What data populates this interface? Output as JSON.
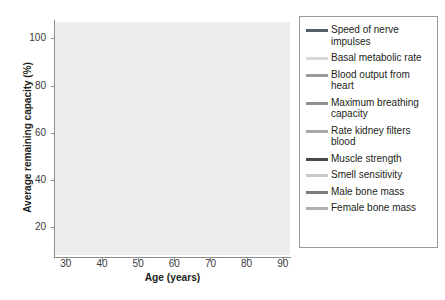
{
  "chart_data": {
    "type": "line",
    "title": "",
    "xlabel": "Age (years)",
    "ylabel": "Average remaining capacity (%)",
    "x": [
      30,
      40,
      50,
      60,
      70,
      80,
      90
    ],
    "xlim": [
      27,
      92
    ],
    "ylim": [
      8,
      107
    ],
    "xticks": [
      "30",
      "40",
      "50",
      "60",
      "70",
      "80",
      "90"
    ],
    "yticks": [
      "20",
      "40",
      "60",
      "80",
      "100"
    ],
    "grid": true,
    "grid_color": "#ffffff",
    "plot_background": "#ededed",
    "legend_position": "right-outside",
    "series": [
      {
        "name": "Speed of nerve impulses",
        "color": "#55606a",
        "width": 2.6,
        "x": [
          30,
          40,
          50,
          60,
          70,
          80
        ],
        "values": [
          100.5,
          100.2,
          99.6,
          99.2,
          98.6,
          98.0
        ]
      },
      {
        "name": "Basal metabolic rate",
        "color": "#d8d8d8",
        "width": 2.6,
        "x": [
          30,
          40,
          50,
          60,
          70,
          80,
          90
        ],
        "values": [
          100.5,
          97.0,
          93.0,
          89.5,
          86.0,
          83.0,
          80.0
        ]
      },
      {
        "name": "Blood output from heart",
        "color": "#9a9a9a",
        "width": 2.8,
        "x": [
          30,
          40,
          50,
          60,
          70,
          80
        ],
        "values": [
          100.5,
          99.4,
          96.8,
          94.5,
          91.0,
          88.4
        ]
      },
      {
        "name": "Maximum breathing capacity",
        "color": "#8f8f8f",
        "width": 2.8,
        "x": [
          30,
          40,
          50,
          60,
          70,
          80
        ],
        "values": [
          100.5,
          96.4,
          91.0,
          88.6,
          86.0,
          76.2
        ]
      },
      {
        "name": "Rate kidney filters blood",
        "color": "#a8a8a8",
        "width": 2.8,
        "x": [
          30,
          40,
          50,
          60,
          70,
          80
        ],
        "values": [
          100.5,
          94.0,
          87.5,
          82.0,
          76.0,
          68.6
        ]
      },
      {
        "name": "Muscle strength",
        "color": "#4a4a4a",
        "width": 3.0,
        "x": [
          30,
          40,
          50,
          60,
          70,
          80
        ],
        "values": [
          100.5,
          98.0,
          93.6,
          89.0,
          85.4,
          62.6
        ]
      },
      {
        "name": "Smell sensitivity",
        "color": "#c9c9c9",
        "width": 2.8,
        "x": [
          30,
          40,
          50,
          60,
          70,
          80
        ],
        "values": [
          100.5,
          95.0,
          89.5,
          84.0,
          78.0,
          57.0
        ]
      },
      {
        "name": "Male bone mass",
        "color": "#7d7d7d",
        "width": 3.0,
        "x": [
          30,
          40,
          50,
          60,
          70,
          80
        ],
        "values": [
          100.5,
          88.0,
          77.0,
          63.0,
          53.0,
          42.0
        ]
      },
      {
        "name": "Female bone mass",
        "color": "#b0b0b0",
        "width": 3.0,
        "x": [
          30,
          40,
          50,
          60,
          70,
          80
        ],
        "values": [
          100.5,
          87.0,
          72.0,
          62.5,
          47.0,
          24.0
        ]
      }
    ]
  },
  "legend": {
    "items": [
      {
        "label": "Speed of nerve impulses",
        "color": "#55606a"
      },
      {
        "label": "Basal metabolic rate",
        "color": "#d8d8d8"
      },
      {
        "label": "Blood output from heart",
        "color": "#9a9a9a"
      },
      {
        "label": "Maximum breathing capacity",
        "color": "#8f8f8f"
      },
      {
        "label": "Rate kidney filters blood",
        "color": "#a8a8a8"
      },
      {
        "label": "Muscle strength",
        "color": "#4a4a4a"
      },
      {
        "label": "Smell sensitivity",
        "color": "#c9c9c9"
      },
      {
        "label": "Male bone mass",
        "color": "#7d7d7d"
      },
      {
        "label": "Female bone mass",
        "color": "#b0b0b0"
      }
    ]
  }
}
